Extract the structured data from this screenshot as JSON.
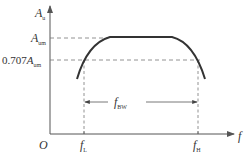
{
  "diagram": {
    "type": "frequency-response",
    "axes": {
      "y_label": "A",
      "y_label_sub": "u",
      "x_label": "f",
      "origin_label": "O"
    },
    "levels": {
      "max_label": "A",
      "max_label_sub": "um",
      "half_power_prefix": "0.707",
      "half_power_label": "A",
      "half_power_label_sub": "um"
    },
    "frequencies": {
      "low_label": "f",
      "low_label_sub": "L",
      "high_label": "f",
      "high_label_sub": "H"
    },
    "bandwidth": {
      "label": "f",
      "label_sub": "BW"
    },
    "colors": {
      "axis": "#555555",
      "curve": "#333333",
      "dashed": "#777777",
      "text": "#333333"
    }
  }
}
